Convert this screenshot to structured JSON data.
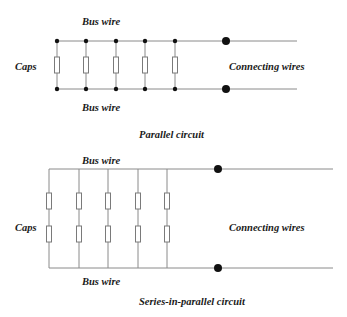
{
  "colors": {
    "wire": "#8a8a8a",
    "node": "#111111",
    "cap_stroke": "#7a7a7a",
    "cap_fill": "#ffffff",
    "text": "#1a1a1a"
  },
  "parallel": {
    "top_bus_label": "Bus wire",
    "bottom_bus_label": "Bus wire",
    "caps_label": "Caps",
    "connecting_label": "Connecting wires",
    "caption": "Parallel circuit",
    "branch_count": 5,
    "caps_per_branch": 1
  },
  "series_parallel": {
    "top_bus_label": "Bus wire",
    "bottom_bus_label": "Bus wire",
    "caps_label": "Caps",
    "connecting_label": "Connecting wires",
    "caption": "Series-in-parallel circuit",
    "branch_count": 5,
    "caps_per_branch": 2
  }
}
